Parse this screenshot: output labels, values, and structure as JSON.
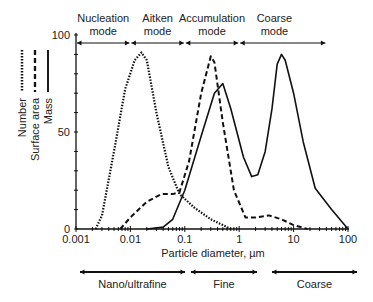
{
  "chart_data": {
    "type": "line",
    "title": "",
    "xlabel": "Particle diameter, µm",
    "ylabel": "",
    "xscale": "log",
    "xlim": [
      0.001,
      100
    ],
    "ylim": [
      0,
      100
    ],
    "x_ticks": [
      "0.001",
      "0.01",
      "0.1",
      "1",
      "10",
      "100"
    ],
    "y_ticks": [
      "0",
      "50",
      "100"
    ],
    "grid": false,
    "legend_position": "left, rotated vertical",
    "series": [
      {
        "name": "Number",
        "style": "dotted",
        "points": [
          [
            0.0023,
            0
          ],
          [
            0.003,
            7
          ],
          [
            0.005,
            40
          ],
          [
            0.008,
            72
          ],
          [
            0.012,
            87
          ],
          [
            0.016,
            91
          ],
          [
            0.02,
            87
          ],
          [
            0.03,
            60
          ],
          [
            0.05,
            32
          ],
          [
            0.08,
            18
          ],
          [
            0.15,
            11
          ],
          [
            0.3,
            5
          ],
          [
            0.5,
            2
          ],
          [
            0.7,
            0
          ]
        ]
      },
      {
        "name": "Surface area",
        "style": "dashed",
        "points": [
          [
            0.0065,
            0
          ],
          [
            0.01,
            6
          ],
          [
            0.02,
            14
          ],
          [
            0.037,
            18
          ],
          [
            0.06,
            18
          ],
          [
            0.08,
            19
          ],
          [
            0.12,
            35
          ],
          [
            0.2,
            70
          ],
          [
            0.3,
            89
          ],
          [
            0.35,
            86
          ],
          [
            0.5,
            55
          ],
          [
            0.8,
            20
          ],
          [
            1.3,
            6
          ],
          [
            2.0,
            6
          ],
          [
            3.5,
            7
          ],
          [
            6,
            5
          ],
          [
            10,
            2
          ],
          [
            18,
            0
          ]
        ]
      },
      {
        "name": "Mass",
        "style": "solid",
        "points": [
          [
            0.02,
            0
          ],
          [
            0.04,
            1
          ],
          [
            0.06,
            5
          ],
          [
            0.1,
            20
          ],
          [
            0.2,
            48
          ],
          [
            0.35,
            70
          ],
          [
            0.5,
            75
          ],
          [
            0.7,
            62
          ],
          [
            1.2,
            37
          ],
          [
            1.7,
            27
          ],
          [
            2.2,
            28
          ],
          [
            3.0,
            40
          ],
          [
            4.0,
            62
          ],
          [
            5,
            85
          ],
          [
            6,
            90
          ],
          [
            7,
            87
          ],
          [
            10,
            70
          ],
          [
            15,
            45
          ],
          [
            25,
            21
          ],
          [
            50,
            10
          ],
          [
            100,
            0
          ]
        ]
      }
    ],
    "annotations": {
      "top_modes": [
        {
          "label_line1": "Nucleation",
          "label_line2": "mode",
          "from": 0.001,
          "to": 0.01
        },
        {
          "label_line1": "Aitken",
          "label_line2": "mode",
          "from": 0.01,
          "to": 0.1
        },
        {
          "label_line1": "Accumulation",
          "label_line2": "mode",
          "from": 0.1,
          "to": 1
        },
        {
          "label_line1": "Coarse",
          "label_line2": "mode",
          "from": 1,
          "to": 40
        }
      ],
      "bottom_ranges": [
        {
          "label": "Nano/ultrafine",
          "from": 0.001,
          "to": 0.1
        },
        {
          "label": "Fine",
          "from": 0.1,
          "to": 2.5
        },
        {
          "label": "Coarse",
          "from": 5,
          "to": 100
        }
      ]
    }
  },
  "legend": [
    {
      "label": "Number",
      "dash": "1.5,1.5",
      "width": 2.2
    },
    {
      "label": "Surface area",
      "dash": "5,3",
      "width": 2
    },
    {
      "label": "Mass",
      "dash": "",
      "width": 1.6
    }
  ],
  "colors": {
    "line": "#111111",
    "text": "#222222",
    "background": "#ffffff"
  }
}
